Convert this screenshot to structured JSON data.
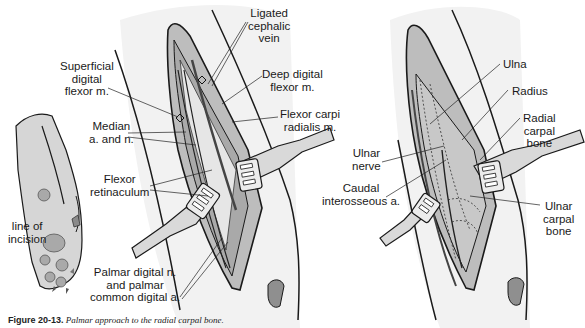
{
  "figure": {
    "caption_number": "Figure 20-13.",
    "caption_text": "Palmar approach to the radial carpal bone.",
    "colors": {
      "line": "#1a1a1a",
      "skin_fill": "#ececec",
      "tissue_mid": "#bdbdbd",
      "tissue_dark": "#8f8f8f",
      "pad_fill": "#a9a9a9",
      "retractor_fill": "#d9d9d9",
      "bone_fill": "#c8c8c8"
    }
  },
  "panels": {
    "paw": {
      "labels": {
        "incision": "line of\nincision"
      }
    },
    "superficial": {
      "labels": {
        "ligated_cephalic_vein": "Ligated\ncephalic\nvein",
        "superficial_digital_flexor": "Superficial\ndigital\nflexor m.",
        "deep_digital_flexor": "Deep digital\nflexor m.",
        "median": "Median\na. and n.",
        "flexor_carpi_radialis": "Flexor carpi\nradialis m.",
        "flexor_retinaculum": "Flexor\nretinaculum",
        "palmar_digital": "Palmar digital n.\nand palmar\ncommon digital a."
      }
    },
    "deep": {
      "labels": {
        "ulna": "Ulna",
        "radius": "Radius",
        "radial_carpal_bone": "Radial\ncarpal\nbone",
        "ulnar_nerve": "Ulnar\nnerve",
        "caudal_interosseous": "Caudal\ninterosseous a.",
        "ulnar_carpal_bone": "Ulnar\ncarpal\nbone"
      }
    }
  }
}
